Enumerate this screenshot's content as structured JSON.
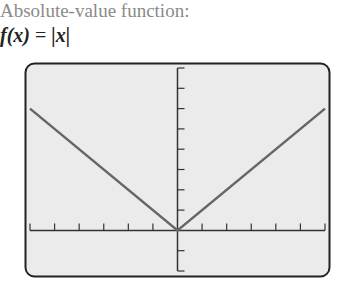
{
  "caption": "Absolute-value function:",
  "formula": {
    "lhs": "f(x)",
    "eq": "=",
    "rhs": "|x|"
  },
  "colors": {
    "screen_bg": "#ebebeb",
    "frame": "#222222",
    "axis": "#333333",
    "curve": "#666666",
    "caption": "#8a8a8a"
  },
  "chart_data": {
    "type": "line",
    "title": "f(x) = |x|",
    "xlabel": "",
    "ylabel": "",
    "xlim": [
      -6,
      6
    ],
    "ylim": [
      -2,
      8
    ],
    "x_tick_step": 1,
    "y_tick_step": 1,
    "grid": false,
    "series": [
      {
        "name": "f(x) = |x|",
        "x": [
          -6,
          0,
          6
        ],
        "y": [
          6,
          0,
          6
        ]
      }
    ]
  }
}
